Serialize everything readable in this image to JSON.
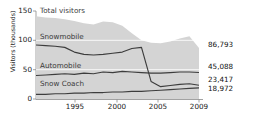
{
  "chart_data": {
    "type": "area",
    "title": "",
    "subtitle": "",
    "xlabel": "",
    "ylabel": "Visitors (thousands)",
    "xlim": [
      1992,
      2009
    ],
    "ylim": [
      0,
      150
    ],
    "yticks": [
      0,
      50,
      100,
      150
    ],
    "xticks": [
      1995,
      2000,
      2005,
      2009
    ],
    "grid": true,
    "legend_position": "inline-labels",
    "x": [
      1992,
      1993,
      1994,
      1995,
      1996,
      1997,
      1998,
      1999,
      2000,
      2001,
      2002,
      2003,
      2004,
      2005,
      2006,
      2007,
      2008,
      2009
    ],
    "series": [
      {
        "name": "Total visitors",
        "style": "area",
        "color": "#d4d4d4",
        "values": [
          141,
          139,
          138,
          136,
          133,
          129,
          127,
          132,
          131,
          125,
          112,
          100,
          96,
          95,
          98,
          103,
          107,
          86.793
        ],
        "end_label": "86,793"
      },
      {
        "name": "Snowmobile",
        "style": "line",
        "color": "#3d3d3d",
        "values": [
          92,
          91,
          90,
          88,
          80,
          76,
          75,
          76,
          78,
          80,
          86,
          88,
          30,
          21,
          23,
          25,
          26,
          23.417
        ],
        "end_label": "23,417"
      },
      {
        "name": "Automobile",
        "style": "line",
        "color": "#3d3d3d",
        "values": [
          40,
          41,
          42,
          43,
          42,
          44,
          43,
          46,
          45,
          47,
          46,
          45,
          44,
          44,
          45,
          46,
          46,
          45.088
        ],
        "end_label": "45,088"
      },
      {
        "name": "Snow Coach",
        "style": "line",
        "color": "#3d3d3d",
        "values": [
          8,
          8,
          9,
          9,
          10,
          10,
          11,
          11,
          12,
          12,
          13,
          13,
          14,
          15,
          16,
          17,
          18,
          18.972
        ],
        "end_label": "18,972"
      }
    ],
    "inline_labels": [
      {
        "text": "Total visitors",
        "x_px": 40,
        "y_px": 11
      },
      {
        "text": "Snowmobile",
        "x_px": 40,
        "y_px": 37
      },
      {
        "text": "Automobile",
        "x_px": 40,
        "y_px": 63
      },
      {
        "text": "Snow Coach",
        "x_px": 40,
        "y_px": 81
      }
    ],
    "end_labels": [
      {
        "text": "86,793",
        "y_px": 45
      },
      {
        "text": "45,088",
        "y_px": 66
      },
      {
        "text": "23,417",
        "y_px": 79
      },
      {
        "text": "18,972",
        "y_px": 87
      }
    ],
    "ytick_labels": [
      "150",
      "100",
      "50",
      "0"
    ],
    "ytick_y_px": [
      11,
      40,
      70,
      99
    ],
    "xtick_labels": [
      "1995",
      "2000",
      "2005",
      "2009"
    ],
    "xtick_x_px": [
      75,
      117,
      158,
      190
    ]
  }
}
